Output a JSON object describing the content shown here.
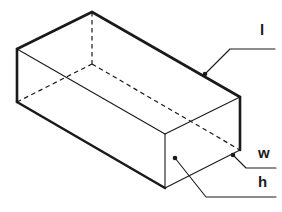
{
  "figure": {
    "name": "rectangular-prism-dimensions",
    "background_color": "#ffffff",
    "stroke_color": "#1a1a1a",
    "hidden_edge_style": "dashed",
    "projection": "oblique"
  },
  "labels": {
    "length": {
      "text": "l",
      "meaning": "length",
      "position": "top-right",
      "leader_target": "top-right-edge"
    },
    "width": {
      "text": "w",
      "meaning": "width",
      "position": "right",
      "leader_target": "bottom-right-corner"
    },
    "height": {
      "text": "h",
      "meaning": "height",
      "position": "bottom-right",
      "leader_target": "front-vertical-edge"
    }
  },
  "geometry": {
    "top_face": {
      "left": [
        17,
        49
      ],
      "back": [
        92,
        12
      ],
      "right": [
        240,
        97
      ],
      "front": [
        165,
        134
      ]
    },
    "bottom_visible": {
      "left": [
        17,
        102
      ],
      "front": [
        165,
        188
      ],
      "right": [
        240,
        150
      ]
    },
    "hidden_vertex": {
      "back_bottom": [
        92,
        64
      ]
    },
    "vertical_edge_length_px": 53
  },
  "leaders": {
    "length_line": "M 205,74 L 230,49 L 275,49",
    "length_dot": [
      205,
      74
    ],
    "width_line": "M 233,155 L 246,168 L 276,168",
    "width_dot": [
      233,
      155
    ],
    "height_line": "M 175,158 L 206,197 L 276,197",
    "height_dot": [
      175,
      158
    ]
  }
}
